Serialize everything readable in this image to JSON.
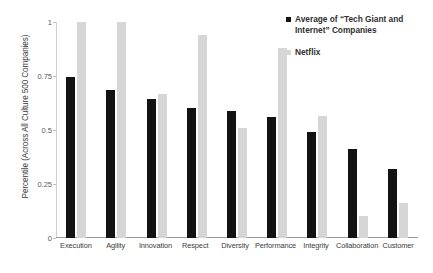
{
  "chart_data": {
    "type": "bar",
    "title": "",
    "xlabel": "",
    "ylabel": "Percentile (Across All Culture 500 Companies)",
    "ylim": [
      0,
      1
    ],
    "yticks": [
      "0",
      "0.25",
      "0.5",
      "0.75",
      "1"
    ],
    "ytick_values": [
      0,
      0.25,
      0.5,
      0.75,
      1
    ],
    "grid": false,
    "legend_position": "top-right",
    "categories": [
      "Execution",
      "Agility",
      "Innovation",
      "Respect",
      "Diversity",
      "Performance",
      "Integrity",
      "Collaboration",
      "Customer"
    ],
    "series": [
      {
        "name": "Average of “Tech Giant and Internet” Companies",
        "color": "#131313",
        "values": [
          0.745,
          0.685,
          0.645,
          0.6,
          0.59,
          0.56,
          0.49,
          0.41,
          0.32
        ]
      },
      {
        "name": "Netflix",
        "color": "#d6d6d6",
        "values": [
          1.0,
          1.0,
          0.665,
          0.94,
          0.51,
          0.88,
          0.565,
          0.1,
          0.16
        ]
      }
    ]
  },
  "legend": {
    "entries": [
      {
        "label": "Average of “Tech Giant and Internet” Companies"
      },
      {
        "label": "Netflix"
      }
    ]
  }
}
